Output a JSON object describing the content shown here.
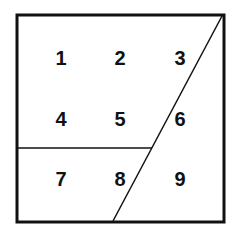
{
  "diagram": {
    "title": "",
    "outer_square": {
      "x1": 17,
      "y1": 15,
      "x2": 224,
      "y2": 222,
      "stroke_width": 3,
      "color": "#111111"
    },
    "horizontal_divider": {
      "x1": 17,
      "y1": 148,
      "x2": 152,
      "y2": 148,
      "stroke_width": 1.5
    },
    "diagonal_divider": {
      "x1": 222,
      "y1": 16,
      "x2": 113,
      "y2": 221,
      "stroke_width": 1.5
    },
    "cells": [
      {
        "label": "1",
        "x": 61,
        "y": 58
      },
      {
        "label": "2",
        "x": 120,
        "y": 58
      },
      {
        "label": "3",
        "x": 180,
        "y": 58
      },
      {
        "label": "4",
        "x": 61,
        "y": 119
      },
      {
        "label": "5",
        "x": 120,
        "y": 119
      },
      {
        "label": "6",
        "x": 180,
        "y": 119
      },
      {
        "label": "7",
        "x": 61,
        "y": 179
      },
      {
        "label": "8",
        "x": 120,
        "y": 179
      },
      {
        "label": "9",
        "x": 180,
        "y": 179
      }
    ]
  }
}
